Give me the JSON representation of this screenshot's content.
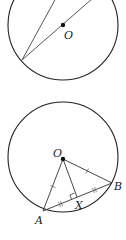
{
  "figures": [
    {
      "id": "top",
      "circle": {
        "cx": 63,
        "cy": 25,
        "r": 55
      },
      "center_label": "O",
      "center_label_pos": [
        64,
        40
      ],
      "lines": [
        {
          "from": [
            22,
            60
          ],
          "to": [
            56,
            -2
          ]
        },
        {
          "from": [
            22,
            60
          ],
          "to": [
            93,
            -2
          ]
        }
      ]
    },
    {
      "id": "bottom",
      "circle": {
        "cx": 63,
        "cy": 157,
        "r": 55
      },
      "center_label": "O",
      "center_label_pos": [
        54,
        158
      ],
      "points": {
        "O": [
          63,
          159
        ],
        "A": [
          43,
          211
        ],
        "B": [
          112,
          183
        ],
        "X": [
          77,
          197
        ]
      },
      "point_labels": {
        "A": "A",
        "B": "B",
        "X": "X"
      },
      "label_positions": {
        "A": [
          36,
          224
        ],
        "B": [
          114,
          190
        ],
        "X": [
          76,
          209
        ]
      }
    }
  ],
  "colors": {
    "stroke": "#222222",
    "background": "#ffffff"
  }
}
